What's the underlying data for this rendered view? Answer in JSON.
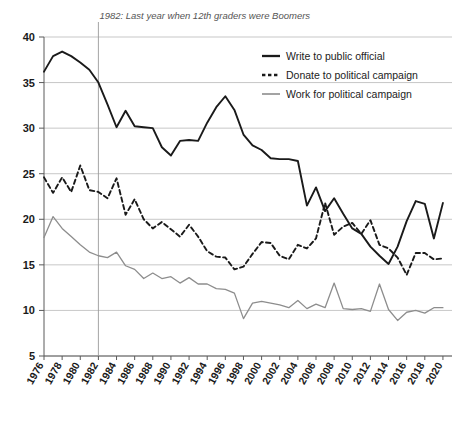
{
  "chart_data": {
    "type": "line",
    "title": "",
    "subtitle": "",
    "xlabel": "",
    "ylabel": "",
    "xlim": [
      1976,
      2021
    ],
    "ylim": [
      5,
      40
    ],
    "yticks": [
      5,
      10,
      15,
      20,
      25,
      30,
      35,
      40
    ],
    "xticks": [
      1976,
      1978,
      1980,
      1982,
      1984,
      1986,
      1988,
      1990,
      1992,
      1994,
      1996,
      1998,
      2000,
      2002,
      2004,
      2006,
      2008,
      2010,
      2012,
      2014,
      2016,
      2018,
      2020
    ],
    "grid": true,
    "legend_position": "top-right",
    "annotations": [
      {
        "text": "1982: Last year when 12th graders were Boomers",
        "x": 1982,
        "type": "vertical-line-label"
      }
    ],
    "x": [
      1976,
      1977,
      1978,
      1979,
      1980,
      1981,
      1982,
      1983,
      1984,
      1985,
      1986,
      1987,
      1988,
      1989,
      1990,
      1991,
      1992,
      1993,
      1994,
      1995,
      1996,
      1997,
      1998,
      1999,
      2000,
      2001,
      2002,
      2003,
      2004,
      2005,
      2006,
      2007,
      2008,
      2009,
      2010,
      2011,
      2012,
      2013,
      2014,
      2015,
      2016,
      2017,
      2018,
      2019,
      2020
    ],
    "series": [
      {
        "name": "Write to public official",
        "style": "solid",
        "color": "#1a1a1a",
        "values": [
          36.2,
          37.9,
          38.4,
          37.9,
          37.2,
          36.4,
          35.0,
          32.6,
          30.1,
          31.9,
          30.2,
          30.1,
          30.0,
          27.9,
          27.0,
          28.6,
          28.7,
          28.6,
          30.6,
          32.3,
          33.5,
          32.0,
          29.3,
          28.1,
          27.6,
          26.7,
          26.6,
          26.6,
          26.4,
          21.5,
          23.5,
          20.9,
          22.3,
          20.6,
          19.0,
          18.4,
          17.0,
          16.0,
          15.1,
          17.0,
          19.8,
          22.0,
          21.7,
          17.9,
          21.8
        ]
      },
      {
        "name": "Donate to political campaign",
        "style": "dashed",
        "color": "#1a1a1a",
        "values": [
          24.6,
          22.9,
          24.6,
          23.0,
          25.9,
          23.2,
          23.0,
          22.3,
          24.5,
          20.5,
          22.2,
          20.0,
          19.0,
          19.7,
          18.9,
          18.1,
          19.4,
          18.1,
          16.5,
          15.9,
          15.8,
          14.5,
          14.8,
          16.2,
          17.5,
          17.4,
          16.0,
          15.6,
          17.2,
          16.8,
          17.9,
          21.8,
          18.3,
          19.2,
          19.6,
          18.4,
          19.9,
          17.2,
          16.8,
          15.8,
          13.9,
          16.3,
          16.3,
          15.6,
          15.7
        ]
      },
      {
        "name": "Work for political campaign",
        "style": "solid",
        "color": "#8d8d8d",
        "values": [
          18.0,
          20.3,
          19.0,
          18.1,
          17.2,
          16.4,
          16.0,
          15.8,
          16.4,
          14.9,
          14.5,
          13.5,
          14.1,
          13.5,
          13.7,
          13.0,
          13.6,
          12.9,
          12.9,
          12.4,
          12.3,
          11.9,
          9.1,
          10.8,
          11.0,
          10.8,
          10.6,
          10.3,
          11.1,
          10.2,
          10.7,
          10.3,
          13.0,
          10.2,
          10.1,
          10.2,
          9.9,
          12.9,
          10.1,
          8.9,
          9.8,
          10.0,
          9.7,
          10.3,
          10.3
        ]
      }
    ]
  },
  "legend": {
    "items": [
      {
        "label": "Write to public official"
      },
      {
        "label": "Donate to political campaign"
      },
      {
        "label": "Work for political campaign"
      }
    ]
  }
}
